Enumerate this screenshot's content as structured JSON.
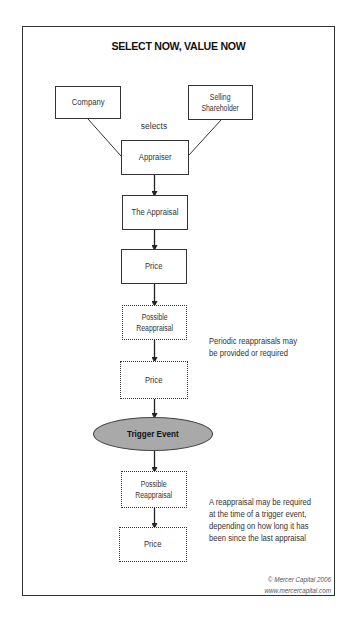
{
  "diagram": {
    "title": "SELECT NOW, VALUE NOW",
    "parties": {
      "company": "Company",
      "selling_shareholder_line1": "Selling",
      "selling_shareholder_line2": "Shareholder"
    },
    "edge_label": "selects",
    "nodes": {
      "appraiser": "Appraiser",
      "the_appraisal": "The Appraisal",
      "price_1": "Price",
      "possible_reappraisal_1_line1": "Possible",
      "possible_reappraisal_1_line2": "Reappraisal",
      "price_2": "Price",
      "trigger_event": "Trigger Event",
      "possible_reappraisal_2_line1": "Possible",
      "possible_reappraisal_2_line2": "Reappraisal",
      "price_3": "Price"
    },
    "annotations": {
      "periodic": [
        "Periodic reappraisals may",
        "be provided or required"
      ],
      "trigger": [
        "A reappraisal may be required",
        "at the time of a trigger event,",
        "depending on how long it has",
        "been since the last appraisal"
      ]
    },
    "credit": {
      "copyright": "© Mercer Capital 2006",
      "url": "www.mercercapital.com"
    },
    "colors": {
      "stroke": "#333333",
      "trigger_fill": "#a9a9a9",
      "background": "#ffffff"
    }
  }
}
